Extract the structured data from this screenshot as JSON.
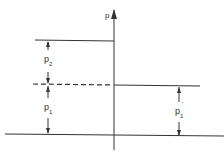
{
  "diagram": {
    "axis_label": "p",
    "labels": {
      "p2": {
        "main": "p",
        "sub": "2"
      },
      "p1": {
        "main": "p",
        "sub": "1"
      },
      "p1_prime": {
        "main": "p",
        "sub": "1",
        "prime": "'"
      }
    },
    "colors": {
      "line": "#333333",
      "background": "#ffffff"
    }
  }
}
